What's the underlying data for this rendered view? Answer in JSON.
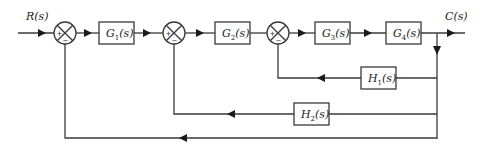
{
  "diagram": {
    "type": "block-diagram",
    "input": {
      "label": "R(s)"
    },
    "output": {
      "label": "C(s)"
    },
    "summing_junctions": [
      {
        "id": "S1",
        "signs": {
          "left": "+",
          "bottom": "−"
        }
      },
      {
        "id": "S2",
        "signs": {
          "left": "+",
          "bottom": "−"
        }
      },
      {
        "id": "S3",
        "signs": {
          "left": "+",
          "bottom": "−"
        }
      }
    ],
    "forward_blocks": [
      {
        "id": "G1",
        "base": "G",
        "sub": "1",
        "arg": "(s)"
      },
      {
        "id": "G2",
        "base": "G",
        "sub": "2",
        "arg": "(s)"
      },
      {
        "id": "G3",
        "base": "G",
        "sub": "3",
        "arg": "(s)"
      },
      {
        "id": "G4",
        "base": "G",
        "sub": "4",
        "arg": "(s)"
      }
    ],
    "feedback_blocks": [
      {
        "id": "H1",
        "base": "H",
        "sub": "1",
        "arg": "(s)",
        "from": "C(s)",
        "to": "S3"
      },
      {
        "id": "H2",
        "base": "H",
        "sub": "2",
        "arg": "(s)",
        "from": "C(s)",
        "to": "S2"
      }
    ],
    "unity_feedback": {
      "from": "C(s)",
      "to": "S1"
    },
    "colors": {
      "line": "#3a3a3a",
      "arrow": "#1a1a1a",
      "background": "#ffffff"
    }
  }
}
